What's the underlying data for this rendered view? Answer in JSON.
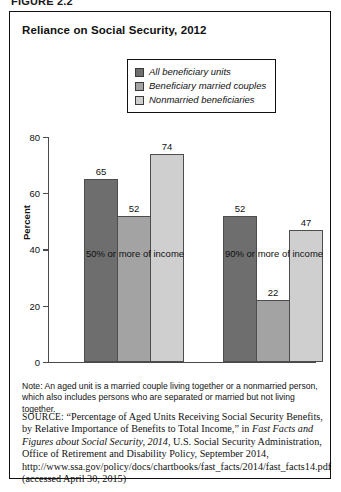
{
  "figure": {
    "number": "FIGURE 2.2"
  },
  "chart": {
    "title": "Reliance on Social Security, 2012",
    "y_title": "Percent"
  },
  "legend": {
    "items": [
      {
        "label": "All beneficiary units",
        "color": "#6e6e6e"
      },
      {
        "label": "Beneficiary married couples",
        "color": "#a3a3a3"
      },
      {
        "label": "Nonmarried beneficiaries",
        "color": "#cfcfcf"
      }
    ]
  },
  "note": {
    "text": "Note: An aged unit is a married couple living together or a nonmarried person, which also includes persons who are separated or married but not living together."
  },
  "source": {
    "label": "SOURCE:",
    "part1": " “Percentage of Aged Units Receiving Social Security Benefits, by Relative Importance of Benefits to Total Income,” in ",
    "italic1": "Fast Facts and Figures about Social Security, 2014",
    "part2": ", U.S. Social Security Administration, Office of Retirement and Disability Policy, September 2014, http://www.ssa.gov/policy/docs/chartbooks/fast_facts/2014/fast_facts14.pdf (accessed April 30, 2015)"
  },
  "chart_data": {
    "type": "bar",
    "title": "Reliance on Social Security, 2012",
    "xlabel": "",
    "ylabel": "Percent",
    "ylim": [
      0,
      80
    ],
    "yticks": [
      0,
      20,
      40,
      60,
      80
    ],
    "grid": false,
    "legend_position": "top-center",
    "categories": [
      "50% or more of income",
      "90% or more of income"
    ],
    "series": [
      {
        "name": "All beneficiary units",
        "color": "#6e6e6e",
        "values": [
          65,
          52
        ]
      },
      {
        "name": "Beneficiary married couples",
        "color": "#a3a3a3",
        "values": [
          52,
          22
        ]
      },
      {
        "name": "Nonmarried beneficiaries",
        "color": "#cfcfcf",
        "values": [
          74,
          47
        ]
      }
    ],
    "bars": [
      {
        "category": "50% or more of income",
        "series": "All beneficiary units",
        "value": 65
      },
      {
        "category": "50% or more of income",
        "series": "Beneficiary married couples",
        "value": 52
      },
      {
        "category": "50% or more of income",
        "series": "Nonmarried beneficiaries",
        "value": 74
      },
      {
        "category": "90% or more of income",
        "series": "All beneficiary units",
        "value": 36
      },
      {
        "category": "90% or more of income",
        "series": "Beneficiary married couples",
        "value": 22
      },
      {
        "category": "90% or more of income",
        "series": "Nonmarried beneficiaries",
        "value": 47
      }
    ]
  }
}
